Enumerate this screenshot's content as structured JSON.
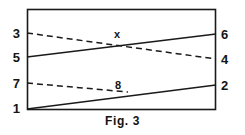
{
  "figure": {
    "caption": "Fig. 3",
    "stroke_color": "#1a1a1a",
    "background_color": "#ffffff",
    "frame": {
      "x": 27,
      "y": 9,
      "width": 189,
      "height": 101
    }
  },
  "terminals": {
    "left": [
      {
        "label": "3",
        "x": 18,
        "y": 33
      },
      {
        "label": "5",
        "x": 18,
        "y": 57
      },
      {
        "label": "7",
        "x": 18,
        "y": 83
      },
      {
        "label": "1",
        "x": 18,
        "y": 108
      }
    ],
    "right": [
      {
        "label": "6",
        "x": 222,
        "y": 34
      },
      {
        "label": "4",
        "x": 222,
        "y": 59
      },
      {
        "label": "2",
        "x": 222,
        "y": 85
      }
    ],
    "inner": [
      {
        "label": "x",
        "x": 117,
        "y": 34
      },
      {
        "label": "8",
        "x": 118,
        "y": 85
      }
    ]
  },
  "connections": [
    {
      "name": "line-3-to-4",
      "style": "dashed",
      "from": "3",
      "to": "4",
      "x1": 27,
      "y1": 33,
      "x2": 216,
      "y2": 59
    },
    {
      "name": "line-5-to-6",
      "style": "solid",
      "from": "5",
      "to": "6",
      "x1": 27,
      "y1": 57,
      "x2": 216,
      "y2": 34
    },
    {
      "name": "line-7-to-8",
      "style": "dashed",
      "from": "7",
      "to": "8",
      "x1": 27,
      "y1": 83,
      "x2": 128,
      "y2": 92
    },
    {
      "name": "line-1-to-2",
      "style": "solid",
      "from": "1",
      "to": "2",
      "x1": 27,
      "y1": 109,
      "x2": 216,
      "y2": 85
    }
  ]
}
